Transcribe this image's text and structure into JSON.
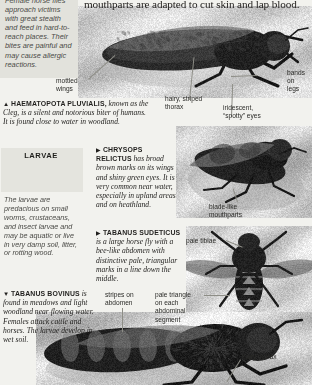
{
  "page": {
    "headline": "mouthparts are adapted to cut skin and lap blood.",
    "intro_paragraph": "Female horse flies approach victims with great stealth and feed in hard-to-reach places. Their bites are painful and may cause allergic reactions."
  },
  "larvae_panel": {
    "title": "LARVAE",
    "caption": "The larvae are predacious on small worms, crustaceans, and insect larvae and may be aquatic or live in very damp soil, litter, or rotting wood."
  },
  "captions": [
    {
      "id": "haematopota",
      "marker": "▲",
      "species": "HAEMATOPOTA PLUVIALIS,",
      "text": " known as the Cleg, is a silent and notorious biter of humans. It is found close to water in woodland."
    },
    {
      "id": "chrysops",
      "marker": "▶",
      "species": "CHRYSOPS RELICTUS",
      "text": " has broad brown marks on its wings and shiny green eyes. It is very common near water, especially in upland areas and on heathland."
    },
    {
      "id": "tabanus-sudeticus",
      "marker": "▶",
      "species": "TABANUS SUDETICUS",
      "text": " is a large horse fly with a bee-like abdomen with distinctive pale, triangular marks in a line down the middle."
    },
    {
      "id": "tabanus-bovinus",
      "marker": "▼",
      "species": "TABANUS BOVINUS",
      "text": " is found in meadows and light woodland near flowing water. Females attack cattle and horses. The larvae develop in wet soil."
    }
  ],
  "callouts": {
    "mottled_wings": "mottled\nwings",
    "bands_on_legs": "bands on\nlegs",
    "hairy_striped_thorax": "hairy, striped\nthorax",
    "iridescent_spotty_eyes": "iridescent,\n“spotty” eyes",
    "blade_like_mouthparts": "blade-like\nmouthparts",
    "pale_tibiae": "pale tibiae",
    "stripes_on_abdomen": "stripes on\nabdomen",
    "pale_triangle": "pale triangle\non each\nabdominal\nsegment",
    "hairy_thorax": "hairy thorax"
  },
  "colors": {
    "page_background": "#f2f2ee",
    "panel_tint": "#e2e2dc",
    "body_text": "#201f1d",
    "callout_text": "#2b2b28",
    "leader_line": "#8d8d86"
  }
}
